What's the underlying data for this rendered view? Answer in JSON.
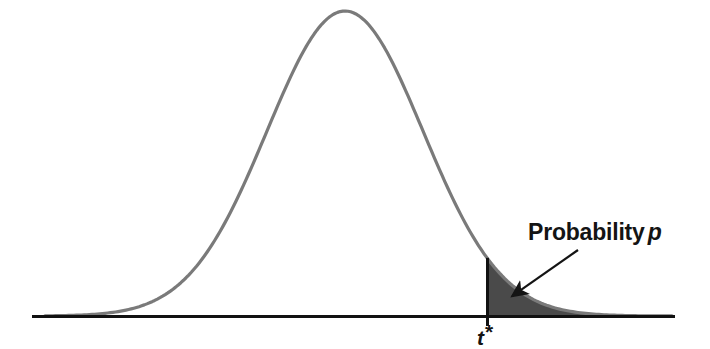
{
  "figure": {
    "name": "t-distribution-p-value-figure",
    "background_color": "#ffffff",
    "annotations": {
      "probability_label": "Probability",
      "probability_symbol": "p",
      "critical_value_symbol": "t",
      "critical_value_star": "*"
    }
  },
  "chart_data": {
    "type": "area",
    "title": "",
    "subtitle": "",
    "xlabel": "",
    "ylabel": "",
    "grid": false,
    "legend": null,
    "axis": {
      "baseline_y_px": 316,
      "x_start_px": 32,
      "x_end_px": 675,
      "axis_color": "#111111",
      "axis_width_px": 3,
      "ticks": [],
      "tick_labels": []
    },
    "curve": {
      "name": "t-distribution-density",
      "shape": "bell",
      "color": "#7a7a7a",
      "stroke_width_px": 3.2,
      "peak_x_px": 345,
      "peak_y_px": 11,
      "left_tail_x_px": 45,
      "right_tail_x_px": 672,
      "spread_sigma_px": 78
    },
    "shaded_region": {
      "name": "upper-tail-probability-p",
      "label": "Probability p",
      "fill_color": "#4a4a4a",
      "from_x_px": 487,
      "to_x_px": 672,
      "side": "right",
      "boundary_line_color": "#111111",
      "boundary_line_width_px": 3
    },
    "markers": [
      {
        "name": "critical-value-t-star",
        "label": "t*",
        "x_px": 487,
        "vertical_line_top_y_px": 228,
        "vertical_line_bottom_y_px": 326
      }
    ],
    "arrow": {
      "name": "probability-callout-arrow",
      "from_x_px": 578,
      "from_y_px": 250,
      "to_x_px": 508,
      "to_y_px": 299,
      "color": "#141414",
      "stroke_width_px": 2.2
    }
  }
}
